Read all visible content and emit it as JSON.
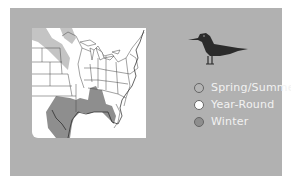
{
  "legend": {
    "items": [
      {
        "label": "Spring/Summer",
        "color": "#b5b5b5"
      },
      {
        "label": "Year-Round",
        "color": "#ffffff"
      },
      {
        "label": "Winter",
        "color": "#8e8e8e"
      }
    ]
  },
  "colors": {
    "panel": "#b1b1b1",
    "map_land": "#ffffff",
    "summer_range": "#c4c4c4",
    "winter_range": "#8e8e8e",
    "bird": "#2b2b2b"
  }
}
